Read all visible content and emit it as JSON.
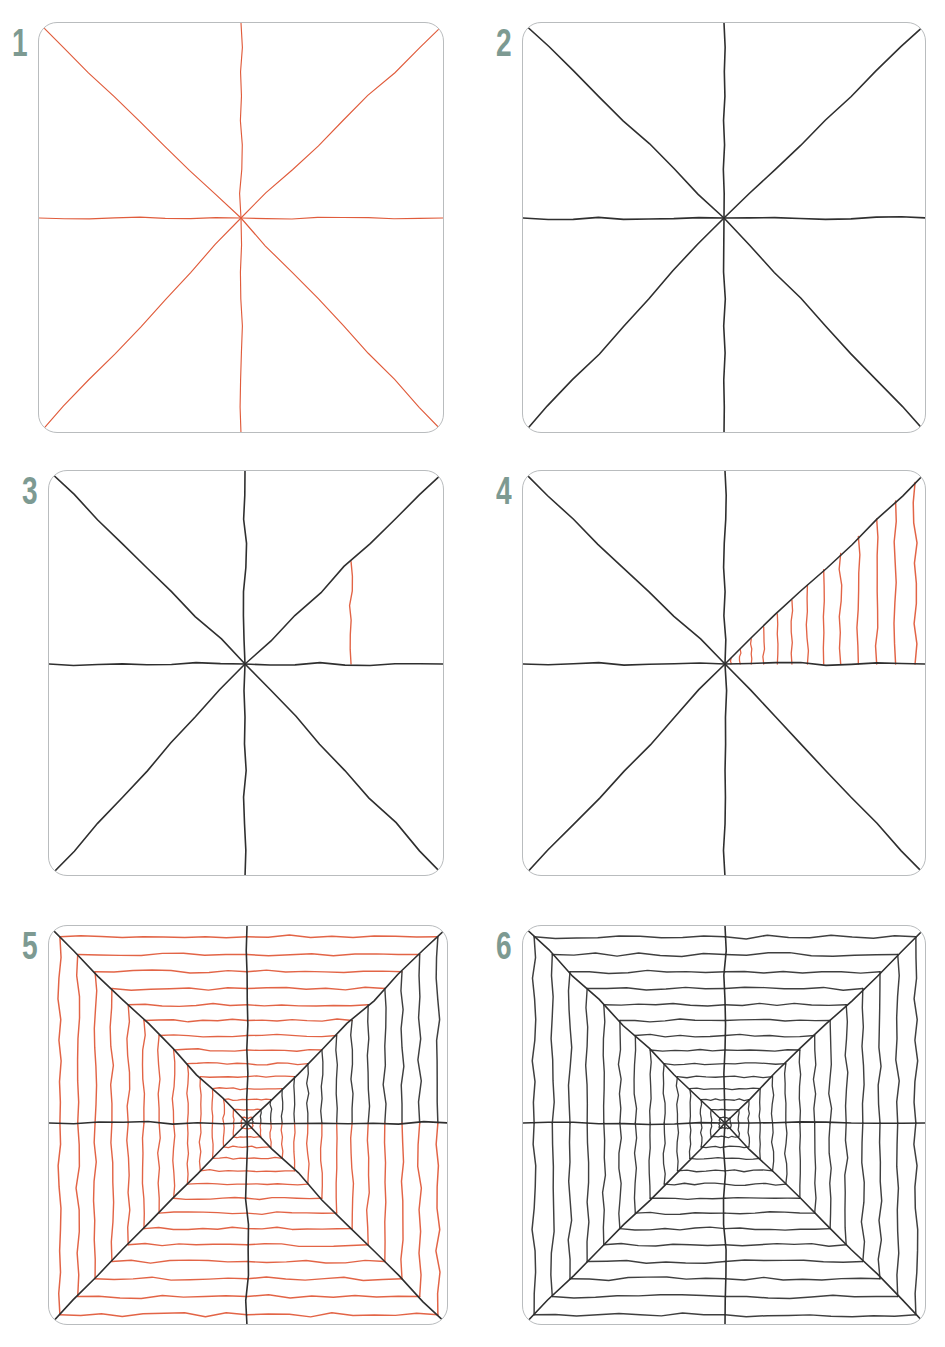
{
  "page": {
    "background_color": "#ffffff",
    "width": 945,
    "height": 1347,
    "columns": 2,
    "rows": 3
  },
  "palette": {
    "new_stroke_red": "#e05c3c",
    "existing_stroke_black": "#2f2f2f",
    "step_number_teal": "#7d9a92",
    "panel_border_gray": "#b9bcbe",
    "paper_white": "#ffffff"
  },
  "steps": [
    {
      "number": "1",
      "number_label": "1",
      "stroke_color": "#e05c3c",
      "description": "Draw eight rays from a center point: vertical, horizontal and two diagonals.",
      "panel": {
        "x": 38,
        "y": 22,
        "w": 406,
        "h": 411
      },
      "center": {
        "x": 202,
        "y": 195
      },
      "rays": 8,
      "chevron_wedges": [],
      "chevron_count": 0,
      "chevron_color": "#e05c3c"
    },
    {
      "number": "2",
      "number_label": "2",
      "stroke_color": "#2f2f2f",
      "description": "The eight rays inked in black.",
      "panel": {
        "x": 522,
        "y": 22,
        "w": 404,
        "h": 411
      },
      "center": {
        "x": 201,
        "y": 195
      },
      "rays": 8,
      "chevron_wedges": [],
      "chevron_count": 0,
      "chevron_color": "#e05c3c"
    },
    {
      "number": "3",
      "number_label": "3",
      "stroke_color": "#2f2f2f",
      "description": "Add the first chevron in the upper-right wedge, hugging the panel corner.",
      "panel": {
        "x": 48,
        "y": 470,
        "w": 396,
        "h": 406
      },
      "center": {
        "x": 196,
        "y": 193
      },
      "rays": 8,
      "chevron_wedges": [
        1
      ],
      "chevron_count": 1,
      "chevron_color": "#e05c3c"
    },
    {
      "number": "4",
      "number_label": "4",
      "stroke_color": "#2f2f2f",
      "description": "Fill that wedge with nested chevrons that shrink toward the center.",
      "panel": {
        "x": 522,
        "y": 470,
        "w": 404,
        "h": 406
      },
      "center": {
        "x": 202,
        "y": 193
      },
      "rays": 8,
      "chevron_wedges": [
        1
      ],
      "chevron_count": 13,
      "chevron_color": "#e05c3c"
    },
    {
      "number": "5",
      "number_label": "5",
      "stroke_color": "#2f2f2f",
      "description": "Repeat the nested chevrons in all remaining wedges.",
      "panel": {
        "x": 48,
        "y": 925,
        "w": 400,
        "h": 400
      },
      "center": {
        "x": 198,
        "y": 197
      },
      "rays": 8,
      "chevron_wedges": [
        0,
        1,
        2,
        3,
        4,
        5,
        6,
        7
      ],
      "black_wedges": [
        1
      ],
      "chevron_count": 14,
      "chevron_color": "#e05c3c"
    },
    {
      "number": "6",
      "number_label": "6",
      "stroke_color": "#2f2f2f",
      "description": "The completed optical illusion, all lines inked in black.",
      "panel": {
        "x": 522,
        "y": 925,
        "w": 404,
        "h": 400
      },
      "center": {
        "x": 202,
        "y": 197
      },
      "rays": 8,
      "chevron_wedges": [
        0,
        1,
        2,
        3,
        4,
        5,
        6,
        7
      ],
      "black_wedges": [
        0,
        1,
        2,
        3,
        4,
        5,
        6,
        7
      ],
      "chevron_count": 14,
      "chevron_color": "#2f2f2f"
    }
  ]
}
